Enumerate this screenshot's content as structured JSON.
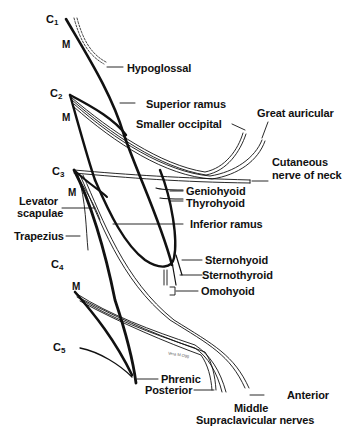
{
  "diagram": {
    "roots": [
      {
        "id": "c1",
        "label": "C",
        "sub": "1"
      },
      {
        "id": "c2",
        "label": "C",
        "sub": "2"
      },
      {
        "id": "c3",
        "label": "C",
        "sub": "3"
      },
      {
        "id": "c4",
        "label": "C",
        "sub": "4"
      },
      {
        "id": "c5",
        "label": "C",
        "sub": "5"
      }
    ],
    "muscular_marker": "M",
    "labels": {
      "hypoglossal": "Hypoglossal",
      "superior_ramus": "Superior ramus",
      "smaller_occipital": "Smaller occipital",
      "great_auricular": "Great auricular",
      "cutaneous_1": "Cutaneous",
      "cutaneous_2": "nerve of neck",
      "geniohyoid": "Geniohyoid",
      "thyrohyoid": "Thyrohyoid",
      "levator_1": "Levator",
      "levator_2": "scapulae",
      "inferior_ramus": "Inferior ramus",
      "trapezius": "Trapezius",
      "sternohyoid": "Sternohyoid",
      "sternothyroid": "Sternothyroid",
      "omohyoid": "Omohyoid",
      "phrenic": "Phrenic",
      "posterior": "Posterior",
      "anterior": "Anterior",
      "middle": "Middle",
      "supraclavicular": "Supraclavicular nerves"
    },
    "signature": "Vera M.Ogg",
    "colors": {
      "ink": "#111111",
      "background": "#ffffff"
    }
  }
}
